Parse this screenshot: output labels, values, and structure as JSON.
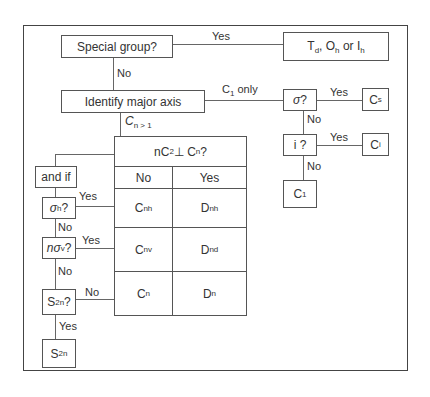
{
  "diagram": {
    "type": "flowchart",
    "nodes": {
      "special_group": "Special group?",
      "special_result": {
        "t": "T",
        "t_sub": "d",
        "sep1": ", O",
        "o_sub": "h",
        "sep2": " or I",
        "i_sub": "h"
      },
      "identify_axis": "Identify major axis",
      "sigma_q": {
        "symbol": "σ",
        "q": "?"
      },
      "cs": {
        "main": "C",
        "sub": "s"
      },
      "i_q": "i ?",
      "ci": {
        "main": "C",
        "sub": "i"
      },
      "c1": {
        "main": "C",
        "sub": "1"
      },
      "and_if": "and if",
      "sigma_h_q": {
        "symbol": "σ",
        "sub": "h",
        "q": "?"
      },
      "n_sigma_v_q": {
        "prefix": "n",
        "symbol": "σ",
        "sub": "v",
        "q": "?"
      },
      "s2n_q": {
        "main": "S",
        "sub": "2n",
        "q": "?"
      },
      "s2n": {
        "main": "S",
        "sub": "2n"
      }
    },
    "edge_labels": {
      "special_yes": "Yes",
      "special_no": "No",
      "c1_only": {
        "main": "C",
        "sub": "1",
        "rest": " only"
      },
      "cn_gt1": {
        "main": "C",
        "sub": "n > 1"
      },
      "sigma_yes": "Yes",
      "sigma_no": "No",
      "i_yes": "Yes",
      "i_no": "No",
      "sigma_h_yes": "Yes",
      "sigma_h_no": "No",
      "n_sigma_v_yes": "Yes",
      "n_sigma_v_no": "No",
      "s2n_no": "No",
      "s2n_yes": "Yes"
    },
    "table": {
      "header": {
        "prefix": "nC",
        "sub": "2",
        "mid": "⊥ C",
        "sub2": "n",
        "q": "?"
      },
      "columns": [
        "No",
        "Yes"
      ],
      "rows": [
        [
          {
            "main": "C",
            "sub": "nh"
          },
          {
            "main": "D",
            "sub": "nh"
          }
        ],
        [
          {
            "main": "C",
            "sub": "nv"
          },
          {
            "main": "D",
            "sub": "nd"
          }
        ],
        [
          {
            "main": "C",
            "sub": "n"
          },
          {
            "main": "D",
            "sub": "n"
          }
        ]
      ]
    }
  }
}
